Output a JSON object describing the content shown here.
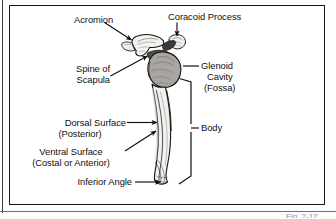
{
  "figure": {
    "subject": "scapula",
    "background_color": "#ffffff",
    "frame_color": "#161616",
    "ink_color": "#101010",
    "bone_fill_color": "#f2f0ec",
    "bone_outline_color": "#141414",
    "glenoid_shade_color": "#a9a6a2",
    "spine_shade_color": "#565350",
    "caption_partial": "Fig. 2-12"
  },
  "labels": {
    "acromion": "Acromion",
    "coracoid_process": "Coracoid Process",
    "spine_of_scapula_line1": "Spine of",
    "spine_of_scapula_line2": "Scapula",
    "glenoid_cavity_line1": "Glenoid",
    "glenoid_cavity_line2": "Cavity",
    "glenoid_cavity_line3": "(Fossa)",
    "body": "Body",
    "dorsal_surface_line1": "Dorsal Surface",
    "dorsal_surface_line2": "(Posterior)",
    "ventral_surface_line1": "Ventral Surface",
    "ventral_surface_line2": "(Costal or Anterior)",
    "inferior_angle": "Inferior Angle"
  },
  "callouts": [
    {
      "name": "acromion",
      "label": "Acromion",
      "pointer": "arrow",
      "direction": "down-right"
    },
    {
      "name": "coracoid-process",
      "label": "Coracoid Process",
      "pointer": "arrow",
      "direction": "down"
    },
    {
      "name": "spine-of-scapula",
      "label": "Spine of Scapula",
      "pointer": "arrow",
      "direction": "up-right"
    },
    {
      "name": "glenoid-cavity",
      "label": "Glenoid Cavity (Fossa)",
      "pointer": "leader-line",
      "direction": "left"
    },
    {
      "name": "body",
      "label": "Body",
      "pointer": "brace",
      "direction": "left"
    },
    {
      "name": "dorsal-surface",
      "label": "Dorsal Surface (Posterior)",
      "pointer": "arrow",
      "direction": "right"
    },
    {
      "name": "ventral-surface",
      "label": "Ventral Surface (Costal or Anterior)",
      "pointer": "arrow",
      "direction": "up-right"
    },
    {
      "name": "inferior-angle",
      "label": "Inferior Angle",
      "pointer": "arrow",
      "direction": "right"
    }
  ]
}
